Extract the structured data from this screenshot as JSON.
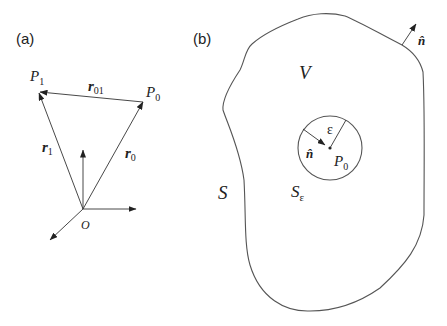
{
  "panels": {
    "a": {
      "label": "(a)",
      "points": {
        "P1": {
          "name": "P",
          "sub": "1"
        },
        "P0": {
          "name": "P",
          "sub": "0"
        },
        "O": {
          "name": "O"
        }
      },
      "vectors": {
        "r01": {
          "name": "r",
          "sub": "01"
        },
        "r1": {
          "name": "r",
          "sub": "1"
        },
        "r0": {
          "name": "r",
          "sub": "0"
        }
      }
    },
    "b": {
      "label": "(b)",
      "volume": "V",
      "surface": "S",
      "outer_normal": "n̂",
      "inner_sphere": {
        "surface": {
          "name": "S",
          "sub": "ε"
        },
        "radius": "ε",
        "normal": "n̂",
        "center": {
          "name": "P",
          "sub": "0"
        }
      }
    }
  },
  "colors": {
    "stroke": "#333333",
    "outline": "#555555",
    "background": "#ffffff"
  }
}
